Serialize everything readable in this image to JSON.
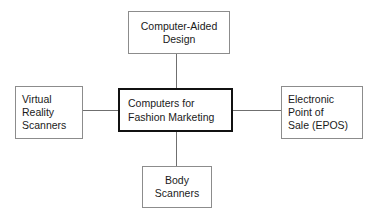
{
  "diagram": {
    "title": "Computers for Fashion Marketing",
    "type": "hub-and-spoke",
    "colors": {
      "background": "#ffffff",
      "hub_border": "#111111",
      "satellite_border": "#8c8c8c",
      "connector": "#6f6f6f",
      "text": "#1a1a1a"
    },
    "hub": {
      "id": "computers-for-fashion-marketing",
      "label": "Computers for\nFashion Marketing",
      "align": "left"
    },
    "nodes": [
      {
        "id": "computer-aided-design",
        "label": "Computer-Aided\nDesign",
        "position": "top",
        "align": "center"
      },
      {
        "id": "virtual-reality-scanners",
        "label": "Virtual\nReality\nScanners",
        "position": "left",
        "align": "left"
      },
      {
        "id": "electronic-point-of-sale",
        "label": "Electronic\nPoint of\nSale (EPOS)",
        "position": "right",
        "align": "left"
      },
      {
        "id": "body-scanners",
        "label": "Body\nScanners",
        "position": "bottom",
        "align": "center"
      }
    ],
    "connectors": [
      {
        "id": "hub-to-top",
        "from": "computers-for-fashion-marketing",
        "to": "computer-aided-design",
        "orientation": "vertical"
      },
      {
        "id": "hub-to-left",
        "from": "computers-for-fashion-marketing",
        "to": "virtual-reality-scanners",
        "orientation": "horizontal"
      },
      {
        "id": "hub-to-right",
        "from": "computers-for-fashion-marketing",
        "to": "electronic-point-of-sale",
        "orientation": "horizontal"
      },
      {
        "id": "hub-to-bottom",
        "from": "computers-for-fashion-marketing",
        "to": "body-scanners",
        "orientation": "vertical"
      }
    ]
  }
}
